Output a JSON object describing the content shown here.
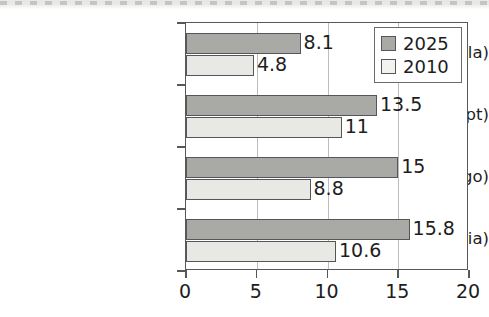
{
  "chart_data": {
    "type": "bar",
    "orientation": "horizontal",
    "title": "",
    "xlabel": "",
    "ylabel": "",
    "xlim": [
      0,
      20
    ],
    "xticks": [
      0,
      5,
      10,
      15,
      20
    ],
    "xtick_labels": [
      "0",
      "5",
      "10",
      "15",
      "20"
    ],
    "grid": true,
    "legend_position": "upper-right",
    "categories": [
      "Luanda (Angola)",
      "Cairo (Egypt)",
      "Kinshasa (Congo)",
      "Lagos (Nigeria)"
    ],
    "series": [
      {
        "name": "2025",
        "color": "#a9a9a6",
        "values": [
          8.1,
          13.5,
          15,
          15.8
        ],
        "value_labels": [
          "8.1",
          "13.5",
          "15",
          "15.8"
        ]
      },
      {
        "name": "2010",
        "color": "#e8e8e4",
        "values": [
          4.8,
          11,
          8.8,
          10.6
        ],
        "value_labels": [
          "4.8",
          "11",
          "8.8",
          "10.6"
        ]
      }
    ]
  },
  "legend": {
    "entries": [
      {
        "label": "2025",
        "swatch": "dark-gray-swatch"
      },
      {
        "label": "2010",
        "swatch": "light-gray-swatch"
      }
    ]
  }
}
